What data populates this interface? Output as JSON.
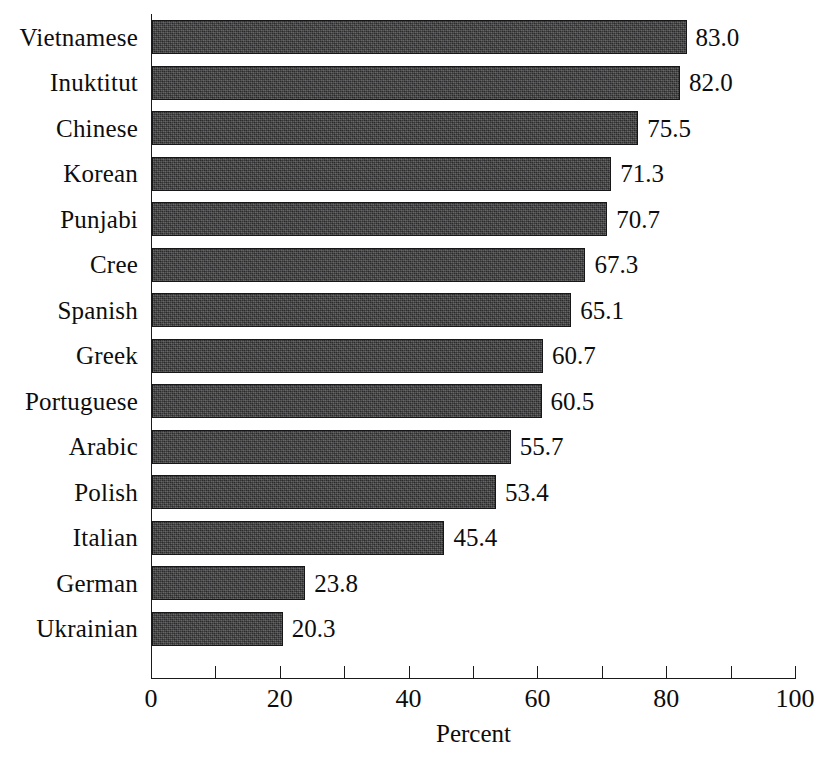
{
  "chart_data": {
    "type": "bar",
    "orientation": "horizontal",
    "title": "",
    "xlabel": "Percent",
    "ylabel": "",
    "xlim": [
      0,
      100
    ],
    "xticks": [
      "0",
      "20",
      "40",
      "60",
      "80",
      "100"
    ],
    "xtick_values": [
      0,
      20,
      40,
      60,
      80,
      100
    ],
    "minor_tick_values": [
      10,
      30,
      50,
      70,
      90
    ],
    "grid": false,
    "legend": null,
    "bar_color": "#3c3c3e",
    "bar_edge_color": "#17171a",
    "background_color": "#ffffff",
    "value_label_format": "one-decimal",
    "categories": [
      "Vietnamese",
      "Inuktitut",
      "Chinese",
      "Korean",
      "Punjabi",
      "Cree",
      "Spanish",
      "Greek",
      "Portuguese",
      "Arabic",
      "Polish",
      "Italian",
      "German",
      "Ukrainian"
    ],
    "values": [
      83.0,
      82.0,
      75.5,
      71.3,
      70.7,
      67.3,
      65.1,
      60.7,
      60.5,
      55.7,
      53.4,
      45.4,
      23.8,
      20.3
    ],
    "value_labels": [
      "83.0",
      "82.0",
      "75.5",
      "71.3",
      "70.7",
      "67.3",
      "65.1",
      "60.7",
      "60.5",
      "55.7",
      "53.4",
      "45.4",
      "23.8",
      "20.3"
    ]
  }
}
